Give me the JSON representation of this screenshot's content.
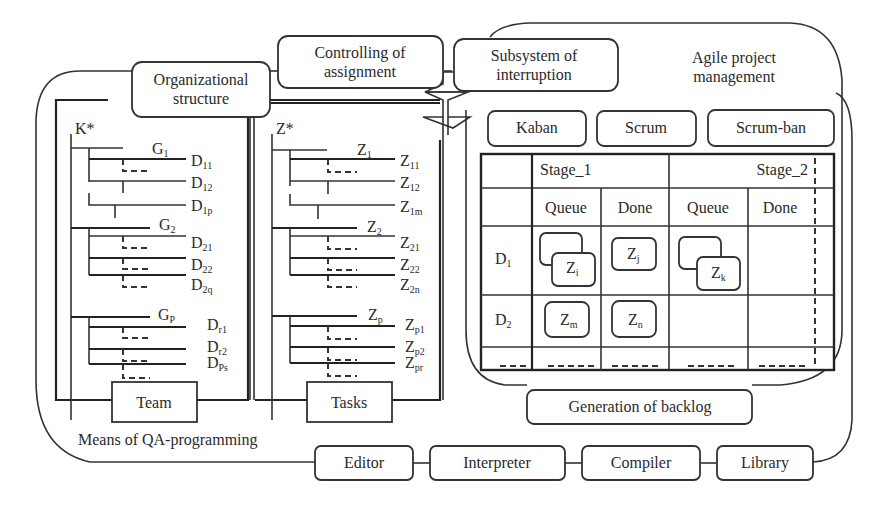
{
  "diagram": {
    "top_boxes": {
      "organizational_structure": [
        "Organizational",
        "structure"
      ],
      "controlling_of_assignment": [
        "Controlling of",
        "assignment"
      ],
      "subsystem_of_interruption": [
        "Subsystem of",
        "interruption"
      ]
    },
    "agile": {
      "title": [
        "Agile project",
        "management"
      ],
      "methods": [
        "Kaban",
        "Scrum",
        "Scrum-ban"
      ],
      "board": {
        "stages": [
          "Stage_1",
          "Stage_2"
        ],
        "columns": [
          "Queue",
          "Done",
          "Queue",
          "Done"
        ],
        "rows": [
          {
            "label": "D",
            "sub": "1"
          },
          {
            "label": "D",
            "sub": "2"
          }
        ],
        "cards": [
          {
            "label": "Z",
            "sub": "i",
            "row": 1,
            "col": 1,
            "stacked": true
          },
          {
            "label": "Z",
            "sub": "j",
            "row": 1,
            "col": 2,
            "stacked": false
          },
          {
            "label": "Z",
            "sub": "k",
            "row": 1,
            "col": 3,
            "stacked": true
          },
          {
            "label": "Z",
            "sub": "m",
            "row": 2,
            "col": 1,
            "stacked": false
          },
          {
            "label": "Z",
            "sub": "n",
            "row": 2,
            "col": 2,
            "stacked": false
          }
        ]
      },
      "backlog": "Generation of backlog"
    },
    "team_tree": {
      "root": "K*",
      "groups": [
        {
          "label": "G",
          "sub": "1",
          "members": [
            {
              "label": "D",
              "sub": "11"
            },
            {
              "label": "D",
              "sub": "12"
            },
            {
              "label": "D",
              "sub": "1p"
            }
          ]
        },
        {
          "label": "G",
          "sub": "2",
          "members": [
            {
              "label": "D",
              "sub": "21"
            },
            {
              "label": "D",
              "sub": "22"
            },
            {
              "label": "D",
              "sub": "2q"
            }
          ]
        },
        {
          "label": "G",
          "sub": "P",
          "members": [
            {
              "label": "D",
              "sub": "r1"
            },
            {
              "label": "D",
              "sub": "r2"
            },
            {
              "label": "D",
              "sub": "Ps"
            }
          ]
        }
      ],
      "footer": "Team"
    },
    "task_tree": {
      "root": "Z*",
      "groups": [
        {
          "label": "Z",
          "sub": "1",
          "members": [
            {
              "label": "Z",
              "sub": "11"
            },
            {
              "label": "Z",
              "sub": "12"
            },
            {
              "label": "Z",
              "sub": "1m"
            }
          ]
        },
        {
          "label": "Z",
          "sub": "2",
          "members": [
            {
              "label": "Z",
              "sub": "21"
            },
            {
              "label": "Z",
              "sub": "22"
            },
            {
              "label": "Z",
              "sub": "2n"
            }
          ]
        },
        {
          "label": "Z",
          "sub": "p",
          "members": [
            {
              "label": "Z",
              "sub": "p1"
            },
            {
              "label": "Z",
              "sub": "p2"
            },
            {
              "label": "Z",
              "sub": "pr"
            }
          ]
        }
      ],
      "footer": "Tasks"
    },
    "qa_means": {
      "label": "Means of QA-programming",
      "tools": [
        "Editor",
        "Interpreter",
        "Compiler",
        "Library"
      ]
    }
  }
}
